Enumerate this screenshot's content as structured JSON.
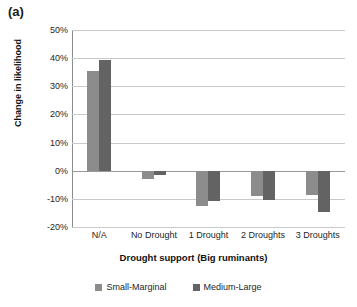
{
  "panel_label": "(a)",
  "chart_data": {
    "type": "bar",
    "title": "",
    "subtitle": "",
    "xlabel": "Drought support (Big ruminants)",
    "ylabel": "Change in likelihood",
    "categories": [
      "N/A",
      "No Drought",
      "1 Drought",
      "2 Droughts",
      "3 Droughts"
    ],
    "series": [
      {
        "name": "Small-Marginal",
        "color": "#8c8c8c",
        "values": [
          35.5,
          -3.0,
          -12.5,
          -9.0,
          -8.7
        ]
      },
      {
        "name": "Medium-Large",
        "color": "#636363",
        "values": [
          39.2,
          -1.6,
          -10.6,
          -10.3,
          -14.8
        ]
      }
    ],
    "ylim": [
      -20,
      50
    ],
    "ytick_values": [
      50,
      40,
      30,
      20,
      10,
      0,
      -10,
      -20
    ],
    "ytick_labels": [
      "50%",
      "40%",
      "30%",
      "20%",
      "10%",
      "0%",
      "-10%",
      "-20%"
    ],
    "grid": true,
    "grid_axis": "y",
    "legend_position": "bottom",
    "bar_orientation": "vertical"
  }
}
